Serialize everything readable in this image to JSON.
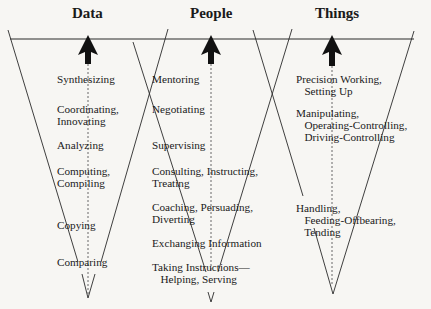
{
  "columns": [
    {
      "title": "Data",
      "functions": [
        {
          "label": "Synthesizing"
        },
        {
          "label": "Coordinating,\nInnovating"
        },
        {
          "label": "Analyzing"
        },
        {
          "label": "Computing,\nCompiling"
        },
        {
          "label": "Copying"
        },
        {
          "label": "Comparing"
        }
      ]
    },
    {
      "title": "People",
      "functions": [
        {
          "label": "Mentoring"
        },
        {
          "label": "Negotiating"
        },
        {
          "label": "Supervising"
        },
        {
          "label": "Consulting, Instructing,\nTreating"
        },
        {
          "label": "Coaching, Persuading,\nDiverting"
        },
        {
          "label": "Exchanging Information"
        },
        {
          "label": "Taking Instructions—\n   Helping, Serving"
        }
      ]
    },
    {
      "title": "Things",
      "functions": [
        {
          "label": "Precision Working,\n   Setting Up"
        },
        {
          "label": "Manipulating,\n   Operating-Controlling,\n   Driving-Controlling"
        },
        {
          "label": "Handling,\n   Feeding-Offbearing,\n   Tending"
        }
      ]
    }
  ],
  "icons": {
    "arrow": "up-arrow"
  },
  "colors": {
    "ink": "#1a1a1a",
    "paper": "#f7f6f3"
  }
}
